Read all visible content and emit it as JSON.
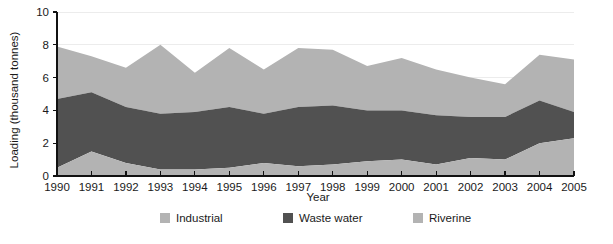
{
  "chart_data": {
    "type": "area",
    "stacked": true,
    "title": "",
    "xlabel": "Year",
    "ylabel": "Loading (thousand tonnes)",
    "categories": [
      "1990",
      "1991",
      "1992",
      "1993",
      "1994",
      "1995",
      "1996",
      "1997",
      "1998",
      "1999",
      "2000",
      "2001",
      "2002",
      "2003",
      "2004",
      "2005"
    ],
    "x": [
      1990,
      1991,
      1992,
      1993,
      1994,
      1995,
      1996,
      1997,
      1998,
      1999,
      2000,
      2001,
      2002,
      2003,
      2004,
      2005
    ],
    "ylim": [
      0,
      10
    ],
    "yticks": [
      0,
      2,
      4,
      6,
      8,
      10
    ],
    "ytick_labels": [
      "0",
      "2",
      "4",
      "6",
      "8",
      "10"
    ],
    "xlim": [
      1990,
      2005
    ],
    "grid": "horizontal",
    "legend_position": "bottom",
    "series": [
      {
        "name": "Industrial",
        "color": "#b3b3b3",
        "stack_order": 0,
        "values": [
          0.5,
          1.5,
          0.8,
          0.4,
          0.4,
          0.5,
          0.8,
          0.6,
          0.7,
          0.9,
          1.0,
          0.7,
          1.1,
          1.0,
          2.0,
          2.3
        ]
      },
      {
        "name": "Waste water",
        "color": "#515151",
        "stack_order": 1,
        "values": [
          4.2,
          3.6,
          3.4,
          3.4,
          3.5,
          3.7,
          3.0,
          3.6,
          3.6,
          3.1,
          3.0,
          3.0,
          2.5,
          2.6,
          2.6,
          1.6
        ]
      },
      {
        "name": "Riverine",
        "color": "#b3b3b3",
        "stack_order": 2,
        "values": [
          3.2,
          2.2,
          2.4,
          4.2,
          2.4,
          3.6,
          2.7,
          3.6,
          3.4,
          2.7,
          3.2,
          2.8,
          2.4,
          2.0,
          2.8,
          3.2
        ]
      }
    ],
    "stack_tops": {
      "industrial": [
        0.5,
        1.5,
        0.8,
        0.4,
        0.4,
        0.5,
        0.8,
        0.6,
        0.7,
        0.9,
        1.0,
        0.7,
        1.1,
        1.0,
        2.0,
        2.3
      ],
      "waste_water": [
        4.7,
        5.1,
        4.2,
        3.8,
        3.9,
        4.2,
        3.8,
        4.2,
        4.3,
        4.0,
        4.0,
        3.7,
        3.6,
        3.6,
        4.6,
        3.9
      ],
      "total": [
        7.9,
        7.3,
        6.6,
        8.0,
        6.3,
        7.8,
        6.5,
        7.8,
        7.7,
        6.7,
        7.2,
        6.5,
        6.0,
        5.6,
        7.4,
        7.1
      ]
    }
  },
  "legend": {
    "items": [
      {
        "label": "Industrial",
        "color": "#b3b3b3"
      },
      {
        "label": "Waste water",
        "color": "#515151"
      },
      {
        "label": "Riverine",
        "color": "#b3b3b3"
      }
    ]
  },
  "colors": {
    "industrial": "#b3b3b3",
    "waste_water": "#515151",
    "riverine": "#b3b3b3",
    "axis": "#111111",
    "grid": "#ececec",
    "background": "#ffffff"
  }
}
